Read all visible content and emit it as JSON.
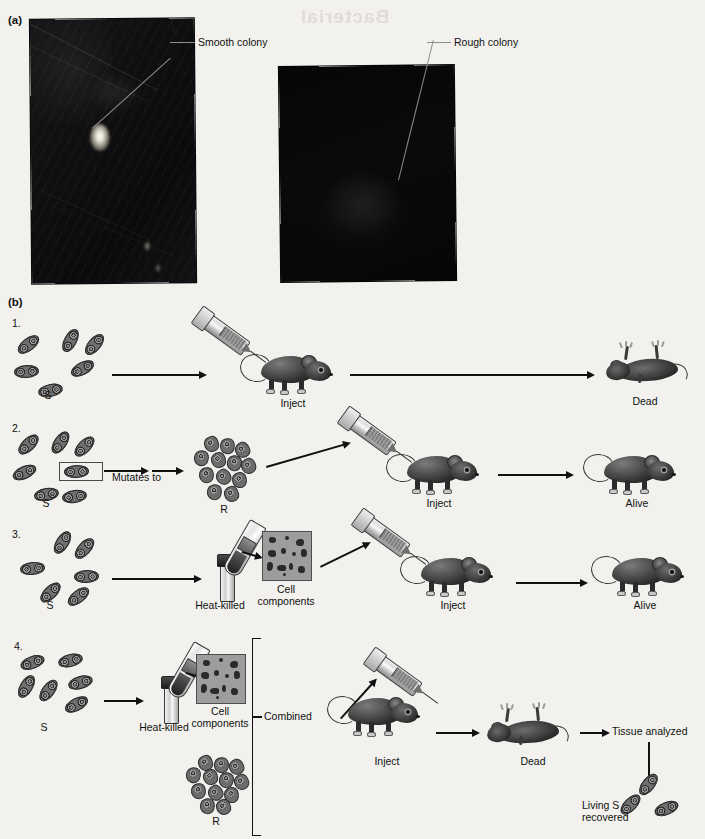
{
  "figure": {
    "ghost_text": "Bacterial",
    "panels": [
      {
        "id": "a",
        "label": "(a)"
      },
      {
        "id": "b",
        "label": "(b)"
      }
    ]
  },
  "panel_a": {
    "callouts": [
      {
        "name": "smooth-colony",
        "text": "Smooth colony"
      },
      {
        "name": "rough-colony",
        "text": "Rough colony"
      }
    ],
    "photos": [
      {
        "name": "smooth-colony-plate",
        "alt": "Agar plate photograph showing a single bright smooth colony"
      },
      {
        "name": "rough-colony-plate",
        "alt": "Agar plate photograph showing a faint rough colony"
      }
    ]
  },
  "panel_b": {
    "steps": [
      {
        "number": "1.",
        "start_cells_label": "S",
        "inject_label": "Inject",
        "outcome_label": "Dead"
      },
      {
        "number": "2.",
        "start_cells_label": "S",
        "mutates_label": "Mutates to",
        "mutant_cells_label": "R",
        "inject_label": "Inject",
        "outcome_label": "Alive"
      },
      {
        "number": "3.",
        "start_cells_label": "S",
        "heat_killed_label": "Heat-killed",
        "cell_components_label": "Cell\ncomponents",
        "inject_label": "Inject",
        "outcome_label": "Alive"
      },
      {
        "number": "4.",
        "start_cells_label": "S",
        "heat_killed_label": "Heat-killed",
        "cell_components_label": "Cell\ncomponents",
        "r_cells_label": "R",
        "combined_label": "Combined",
        "inject_label": "Inject",
        "outcome_label": "Dead",
        "tissue_label": "Tissue analyzed",
        "recovered_label": "Living S\nrecovered"
      }
    ]
  },
  "colors": {
    "page_background": "#f2f1ed",
    "ink": "#111111",
    "leader_line": "#8f8f8f",
    "photo_dark": "#0b0b0c",
    "cell_fill": "#6f6f6f",
    "cell_outline": "#2e2e2e",
    "components_box": "#9d9d9d"
  }
}
